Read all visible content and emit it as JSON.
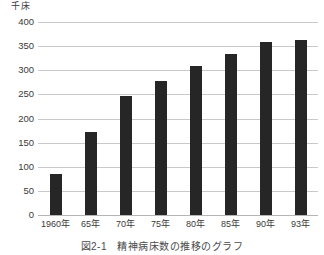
{
  "figure": {
    "unit_label": "千床",
    "caption": "図2-1　精神病床数の推移のグラフ"
  },
  "colors": {
    "bar": "#262626",
    "gridline": "#c9c9c9",
    "baseline": "#b5b5b5",
    "text": "#3a3a3a",
    "background": "#ffffff"
  },
  "chart_data": {
    "type": "bar",
    "title": "図2-1　精神病床数の推移のグラフ",
    "xlabel": "",
    "ylabel": "千床",
    "ylim": [
      0,
      400
    ],
    "ytick_values": [
      0,
      50,
      100,
      150,
      200,
      250,
      300,
      350,
      400
    ],
    "ytick_labels": [
      "0",
      "50",
      "100",
      "150",
      "200",
      "250",
      "300",
      "350",
      "400"
    ],
    "grid": true,
    "legend": false,
    "categories": [
      "1960年",
      "65年",
      "70年",
      "75年",
      "80年",
      "85年",
      "90年",
      "93年"
    ],
    "values": [
      85,
      172,
      247,
      277,
      308,
      334,
      358,
      362
    ],
    "series": [
      {
        "name": "精神病床数",
        "values": [
          85,
          172,
          247,
          277,
          308,
          334,
          358,
          362
        ]
      }
    ]
  }
}
